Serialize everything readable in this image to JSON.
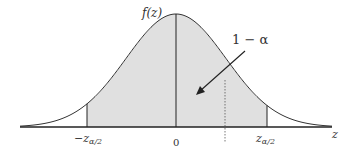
{
  "diagram": {
    "y_axis_label": "f(z)",
    "x_axis_label": "z",
    "area_label": "1 − α",
    "ticks": [
      {
        "label_main": "−z",
        "label_sub": "α/2",
        "name": "neg-critical"
      },
      {
        "label_main": "0",
        "label_sub": "",
        "name": "zero"
      },
      {
        "label_main": "z",
        "label_sub": "α/2",
        "name": "pos-critical"
      }
    ],
    "colors": {
      "shade": "#e0e0e0",
      "curve": "#333333",
      "axis": "#222222"
    }
  }
}
